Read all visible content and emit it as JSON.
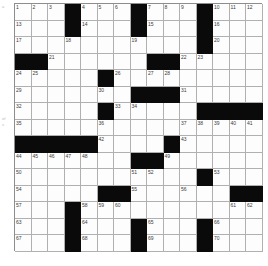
{
  "page": {
    "background_color": "#ffffff",
    "margin_notes": [
      "a",
      "of",
      "s"
    ]
  },
  "crossword": {
    "title": "",
    "rows": 15,
    "cols": 15,
    "cell_size_px": 16.5,
    "fill_color": "#fdfdfd",
    "block_color": "#0a0a0a",
    "grid_line_color": "#b0b0b0",
    "number_color": "#3a3a3a",
    "max_number": 70,
    "grid": [
      [
        "1",
        "2",
        "3",
        "#",
        "4",
        "5",
        "6",
        "#",
        "7",
        "8",
        "9",
        "#",
        "10",
        "11",
        "12"
      ],
      [
        "13",
        "",
        "",
        "#",
        "14",
        "",
        "",
        "#",
        "15",
        "",
        "",
        "#",
        "16",
        "",
        ""
      ],
      [
        "17",
        "",
        "",
        "18",
        "",
        "",
        "",
        "19",
        "",
        "",
        "",
        "#",
        "20",
        "",
        ""
      ],
      [
        "#",
        "#",
        "21",
        "",
        "",
        "",
        "",
        "",
        "#",
        "#",
        "22",
        "23",
        "",
        "",
        ""
      ],
      [
        "24",
        "25",
        "",
        "",
        "",
        "#",
        "26",
        "",
        "27",
        "28",
        "",
        "",
        "",
        "",
        ""
      ],
      [
        "29",
        "",
        "",
        "",
        "",
        "30",
        "",
        "#",
        "#",
        "#",
        "31",
        "",
        "",
        "",
        ""
      ],
      [
        "32",
        "",
        "",
        "",
        "",
        "#",
        "33",
        "34",
        "",
        "",
        "",
        "#",
        "#",
        "#",
        "#"
      ],
      [
        "35",
        "",
        "",
        "",
        "",
        "36",
        "",
        "",
        "",
        "",
        "37",
        "38",
        "39",
        "40",
        "41"
      ],
      [
        "#",
        "#",
        "#",
        "#",
        "#",
        "42",
        "",
        "",
        "",
        "#",
        "43",
        "",
        "",
        "",
        ""
      ],
      [
        "44",
        "45",
        "46",
        "47",
        "48",
        "",
        "",
        "#",
        "#",
        "49",
        "",
        "",
        "",
        "",
        ""
      ],
      [
        "50",
        "",
        "",
        "",
        "",
        "",
        "",
        "51",
        "52",
        "",
        "",
        "#",
        "53",
        "",
        ""
      ],
      [
        "54",
        "",
        "",
        "",
        "",
        "#",
        "#",
        "55",
        "",
        "",
        "56",
        "",
        "",
        "#",
        "#"
      ],
      [
        "57",
        "",
        "",
        "#",
        "58",
        "59",
        "60",
        "",
        "",
        "",
        "",
        "",
        "",
        "61",
        "62"
      ],
      [
        "63",
        "",
        "",
        "#",
        "64",
        "",
        "",
        "#",
        "65",
        "",
        "",
        "#",
        "66",
        "",
        ""
      ],
      [
        "67",
        "",
        "",
        "#",
        "68",
        "",
        "",
        "#",
        "69",
        "",
        "",
        "#",
        "70",
        "",
        ""
      ]
    ],
    "entries": [
      {
        "number": 1,
        "row": 1,
        "col": 1
      },
      {
        "number": 2,
        "row": 1,
        "col": 2
      },
      {
        "number": 3,
        "row": 1,
        "col": 3
      },
      {
        "number": 4,
        "row": 1,
        "col": 5
      },
      {
        "number": 5,
        "row": 1,
        "col": 6
      },
      {
        "number": 6,
        "row": 1,
        "col": 7
      },
      {
        "number": 7,
        "row": 1,
        "col": 9
      },
      {
        "number": 8,
        "row": 1,
        "col": 10
      },
      {
        "number": 9,
        "row": 1,
        "col": 11
      },
      {
        "number": 10,
        "row": 1,
        "col": 13
      },
      {
        "number": 11,
        "row": 1,
        "col": 14
      },
      {
        "number": 12,
        "row": 1,
        "col": 15
      },
      {
        "number": 13,
        "row": 2,
        "col": 1
      },
      {
        "number": 14,
        "row": 2,
        "col": 5
      },
      {
        "number": 15,
        "row": 2,
        "col": 9
      },
      {
        "number": 16,
        "row": 2,
        "col": 13
      },
      {
        "number": 17,
        "row": 3,
        "col": 1
      },
      {
        "number": 18,
        "row": 3,
        "col": 4
      },
      {
        "number": 19,
        "row": 3,
        "col": 8
      },
      {
        "number": 20,
        "row": 3,
        "col": 13
      },
      {
        "number": 21,
        "row": 4,
        "col": 3
      },
      {
        "number": 22,
        "row": 4,
        "col": 11
      },
      {
        "number": 23,
        "row": 4,
        "col": 12
      },
      {
        "number": 24,
        "row": 5,
        "col": 1
      },
      {
        "number": 25,
        "row": 5,
        "col": 2
      },
      {
        "number": 26,
        "row": 5,
        "col": 7
      },
      {
        "number": 27,
        "row": 5,
        "col": 9
      },
      {
        "number": 28,
        "row": 5,
        "col": 10
      },
      {
        "number": 29,
        "row": 6,
        "col": 1
      },
      {
        "number": 30,
        "row": 6,
        "col": 6
      },
      {
        "number": 31,
        "row": 6,
        "col": 11
      },
      {
        "number": 32,
        "row": 7,
        "col": 1
      },
      {
        "number": 33,
        "row": 7,
        "col": 7
      },
      {
        "number": 34,
        "row": 7,
        "col": 8
      },
      {
        "number": 35,
        "row": 8,
        "col": 1
      },
      {
        "number": 36,
        "row": 8,
        "col": 6
      },
      {
        "number": 37,
        "row": 8,
        "col": 11
      },
      {
        "number": 38,
        "row": 8,
        "col": 12
      },
      {
        "number": 39,
        "row": 8,
        "col": 13
      },
      {
        "number": 40,
        "row": 8,
        "col": 14
      },
      {
        "number": 41,
        "row": 8,
        "col": 15
      },
      {
        "number": 42,
        "row": 9,
        "col": 6
      },
      {
        "number": 43,
        "row": 9,
        "col": 11
      },
      {
        "number": 44,
        "row": 10,
        "col": 1
      },
      {
        "number": 45,
        "row": 10,
        "col": 2
      },
      {
        "number": 46,
        "row": 10,
        "col": 3
      },
      {
        "number": 47,
        "row": 10,
        "col": 4
      },
      {
        "number": 48,
        "row": 10,
        "col": 5
      },
      {
        "number": 49,
        "row": 10,
        "col": 10
      },
      {
        "number": 50,
        "row": 11,
        "col": 1
      },
      {
        "number": 51,
        "row": 11,
        "col": 8
      },
      {
        "number": 52,
        "row": 11,
        "col": 9
      },
      {
        "number": 53,
        "row": 11,
        "col": 13
      },
      {
        "number": 54,
        "row": 12,
        "col": 1
      },
      {
        "number": 55,
        "row": 12,
        "col": 8
      },
      {
        "number": 56,
        "row": 12,
        "col": 11
      },
      {
        "number": 57,
        "row": 13,
        "col": 1
      },
      {
        "number": 58,
        "row": 13,
        "col": 5
      },
      {
        "number": 59,
        "row": 13,
        "col": 6
      },
      {
        "number": 60,
        "row": 13,
        "col": 7
      },
      {
        "number": 61,
        "row": 13,
        "col": 14
      },
      {
        "number": 62,
        "row": 13,
        "col": 15
      },
      {
        "number": 63,
        "row": 14,
        "col": 1
      },
      {
        "number": 64,
        "row": 14,
        "col": 5
      },
      {
        "number": 65,
        "row": 14,
        "col": 9
      },
      {
        "number": 66,
        "row": 14,
        "col": 13
      },
      {
        "number": 67,
        "row": 15,
        "col": 1
      },
      {
        "number": 68,
        "row": 15,
        "col": 5
      },
      {
        "number": 69,
        "row": 15,
        "col": 9
      },
      {
        "number": 70,
        "row": 15,
        "col": 13
      }
    ]
  }
}
